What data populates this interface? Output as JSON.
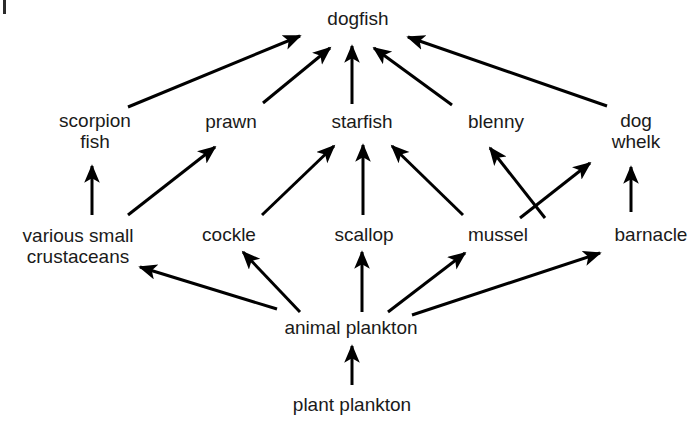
{
  "diagram": {
    "type": "food-web",
    "stroke_color": "#000000",
    "text_color": "#1a1a1a",
    "background_color": "#ffffff",
    "corner_mark": {
      "name": "scan-artifact-mark",
      "visible": true
    },
    "nodes": [
      {
        "id": "dogfish",
        "label": "dogfish",
        "lines": [
          "dogfish"
        ],
        "x": 358,
        "y": 18,
        "trophic_level": 5
      },
      {
        "id": "scorpionfish",
        "label": "scorpion fish",
        "lines": [
          "scorpion",
          "fish"
        ],
        "x": 95,
        "y": 131,
        "trophic_level": 4
      },
      {
        "id": "prawn",
        "label": "prawn",
        "lines": [
          "prawn"
        ],
        "x": 231,
        "y": 121,
        "trophic_level": 4
      },
      {
        "id": "starfish",
        "label": "starfish",
        "lines": [
          "starfish"
        ],
        "x": 362,
        "y": 121,
        "trophic_level": 4
      },
      {
        "id": "blenny",
        "label": "blenny",
        "lines": [
          "blenny"
        ],
        "x": 496,
        "y": 121,
        "trophic_level": 4
      },
      {
        "id": "dogwhelk",
        "label": "dog whelk",
        "lines": [
          "dog",
          "whelk"
        ],
        "x": 636,
        "y": 131,
        "trophic_level": 4
      },
      {
        "id": "crustaceans",
        "label": "various small crustaceans",
        "lines": [
          "various small",
          "crustaceans"
        ],
        "x": 78,
        "y": 246,
        "trophic_level": 3
      },
      {
        "id": "cockle",
        "label": "cockle",
        "lines": [
          "cockle"
        ],
        "x": 229,
        "y": 234,
        "trophic_level": 3
      },
      {
        "id": "scallop",
        "label": "scallop",
        "lines": [
          "scallop"
        ],
        "x": 364,
        "y": 234,
        "trophic_level": 3
      },
      {
        "id": "mussel",
        "label": "mussel",
        "lines": [
          "mussel"
        ],
        "x": 498,
        "y": 234,
        "trophic_level": 3
      },
      {
        "id": "barnacle",
        "label": "barnacle",
        "lines": [
          "barnacle"
        ],
        "x": 651,
        "y": 234,
        "trophic_level": 3
      },
      {
        "id": "animalplankton",
        "label": "animal plankton",
        "lines": [
          "animal plankton"
        ],
        "x": 351,
        "y": 327,
        "trophic_level": 2
      },
      {
        "id": "plantplankton",
        "label": "plant plankton",
        "lines": [
          "plant plankton"
        ],
        "x": 352,
        "y": 404,
        "trophic_level": 1
      }
    ],
    "edges": [
      {
        "from": "scorpionfish",
        "to": "dogfish",
        "x1": 128,
        "y1": 107,
        "x2": 300,
        "y2": 36
      },
      {
        "from": "prawn",
        "to": "dogfish",
        "x1": 263,
        "y1": 103,
        "x2": 330,
        "y2": 48
      },
      {
        "from": "starfish",
        "to": "dogfish",
        "x1": 352,
        "y1": 104,
        "x2": 352,
        "y2": 46
      },
      {
        "from": "blenny",
        "to": "dogfish",
        "x1": 452,
        "y1": 105,
        "x2": 374,
        "y2": 48
      },
      {
        "from": "dogwhelk",
        "to": "dogfish",
        "x1": 607,
        "y1": 106,
        "x2": 408,
        "y2": 37
      },
      {
        "from": "crustaceans",
        "to": "scorpionfish",
        "x1": 92,
        "y1": 215,
        "x2": 92,
        "y2": 166
      },
      {
        "from": "crustaceans",
        "to": "prawn",
        "x1": 128,
        "y1": 215,
        "x2": 215,
        "y2": 147
      },
      {
        "from": "cockle",
        "to": "starfish",
        "x1": 262,
        "y1": 215,
        "x2": 334,
        "y2": 146
      },
      {
        "from": "scallop",
        "to": "starfish",
        "x1": 363,
        "y1": 215,
        "x2": 363,
        "y2": 145
      },
      {
        "from": "mussel",
        "to": "starfish",
        "x1": 463,
        "y1": 215,
        "x2": 392,
        "y2": 146
      },
      {
        "from": "barnacle",
        "to": "blenny",
        "x1": 545,
        "y1": 218,
        "x2": 490,
        "y2": 148
      },
      {
        "from": "mussel",
        "to": "dogwhelk",
        "x1": 520,
        "y1": 218,
        "x2": 590,
        "y2": 163
      },
      {
        "from": "barnacle",
        "to": "dogwhelk",
        "x1": 631,
        "y1": 212,
        "x2": 631,
        "y2": 167
      },
      {
        "from": "animalplankton",
        "to": "crustaceans",
        "x1": 277,
        "y1": 309,
        "x2": 140,
        "y2": 267
      },
      {
        "from": "animalplankton",
        "to": "cockle",
        "x1": 300,
        "y1": 312,
        "x2": 243,
        "y2": 252
      },
      {
        "from": "animalplankton",
        "to": "scallop",
        "x1": 362,
        "y1": 312,
        "x2": 362,
        "y2": 252
      },
      {
        "from": "animalplankton",
        "to": "mussel",
        "x1": 388,
        "y1": 312,
        "x2": 465,
        "y2": 253
      },
      {
        "from": "animalplankton",
        "to": "barnacle",
        "x1": 412,
        "y1": 315,
        "x2": 600,
        "y2": 253
      },
      {
        "from": "plantplankton",
        "to": "animalplankton",
        "x1": 352,
        "y1": 385,
        "x2": 352,
        "y2": 346
      }
    ]
  }
}
